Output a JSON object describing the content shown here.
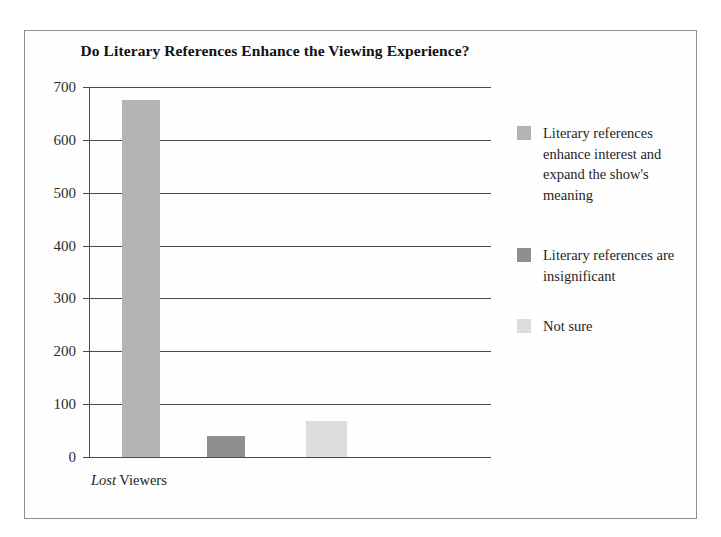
{
  "chart_data": {
    "type": "bar",
    "title": "Do Literary References Enhance the Viewing Experience?",
    "xlabel": "Lost Viewers",
    "xlabel_italic_part": "Lost",
    "xlabel_plain_part": " Viewers",
    "ylabel": "",
    "ylim": [
      0,
      700
    ],
    "ytick_values": [
      700,
      600,
      500,
      400,
      300,
      200,
      100,
      0
    ],
    "ytick_labels": [
      "700",
      "600",
      "500",
      "400",
      "300",
      "200",
      "100",
      "0"
    ],
    "grid": true,
    "legend_position": "right",
    "categories": [
      "Literary references enhance interest and expand the show's meaning",
      "Literary references are insignificant",
      "Not sure"
    ],
    "values": [
      675,
      40,
      68
    ],
    "colors": [
      "#b4b4b4",
      "#8f8f8f",
      "#dddddd"
    ],
    "series": [
      {
        "name": "Lost Viewers",
        "values": [
          675,
          40,
          68
        ]
      }
    ],
    "bars": [
      {
        "label": "Literary references enhance interest and expand the show's meaning",
        "value": 675,
        "color": "#b4b4b4"
      },
      {
        "label": "Literary references are insignificant",
        "value": 40,
        "color": "#8f8f8f"
      },
      {
        "label": "Not sure",
        "value": 68,
        "color": "#dddddd"
      }
    ]
  },
  "legend": {
    "items": [
      {
        "label": "Literary references enhance interest and expand the show's meaning",
        "color": "#b4b4b4"
      },
      {
        "label": "Literary references are insignificant",
        "color": "#8f8f8f"
      },
      {
        "label": "Not sure",
        "color": "#dddddd"
      }
    ]
  }
}
